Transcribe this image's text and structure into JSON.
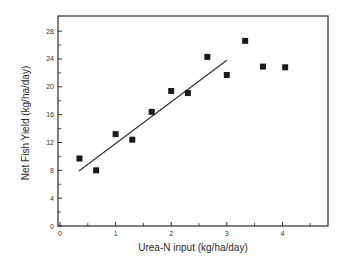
{
  "chart_data": {
    "type": "scatter",
    "title": "",
    "xlabel": "Urea-N input (kg/ha/day)",
    "ylabel": "Net Fish Yield (kg/ha/day)",
    "xlim": [
      0,
      4.85
    ],
    "ylim": [
      0,
      30
    ],
    "x_ticks_major": [
      0,
      1,
      2,
      3,
      4
    ],
    "x_ticks_minor": [
      0.5,
      1.5,
      2.5,
      3.5,
      4.5
    ],
    "y_ticks_major": [
      0,
      4,
      8,
      12,
      16,
      20,
      24,
      28
    ],
    "y_ticks_minor": [
      2,
      6,
      10,
      14,
      18,
      22,
      26
    ],
    "grid": false,
    "legend": null,
    "series": [
      {
        "name": "observed",
        "marker": "square",
        "color": "#1a1a1a",
        "points": [
          {
            "x": 0.35,
            "y": 9.7
          },
          {
            "x": 0.65,
            "y": 8.0
          },
          {
            "x": 1.0,
            "y": 13.2
          },
          {
            "x": 1.3,
            "y": 12.4
          },
          {
            "x": 1.65,
            "y": 16.4
          },
          {
            "x": 2.0,
            "y": 19.4
          },
          {
            "x": 2.3,
            "y": 19.1
          },
          {
            "x": 2.65,
            "y": 24.3
          },
          {
            "x": 3.0,
            "y": 21.7
          },
          {
            "x": 3.33,
            "y": 26.6
          },
          {
            "x": 3.65,
            "y": 22.9
          },
          {
            "x": 4.05,
            "y": 22.8
          }
        ]
      }
    ],
    "fit_line": {
      "name": "linear fit",
      "color": "#333333",
      "x": [
        0.34,
        3.0
      ],
      "y": [
        7.9,
        23.8
      ]
    }
  },
  "layout": {
    "plot_left": 58,
    "plot_right": 328,
    "plot_top": 16,
    "plot_bottom": 226,
    "x_origin_px": 60,
    "x_px_per_unit": 55.6,
    "y_origin_px": 226,
    "y_px_per_unit": 6.96,
    "marker_size": 6,
    "frame_color": "#2b2b2b"
  }
}
